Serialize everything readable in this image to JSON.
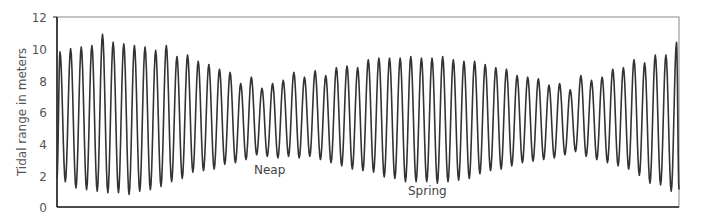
{
  "chart_data": {
    "type": "line",
    "title": "",
    "xlabel": "",
    "ylabel": "Tidal range in meters",
    "ylim": [
      0,
      12
    ],
    "yticks": [
      0,
      2,
      4,
      6,
      8,
      10,
      12
    ],
    "grid": false,
    "legend": null,
    "annotations": [
      {
        "text": "Neap",
        "x_px": 254,
        "y_value": 2.4
      },
      {
        "text": "Spring",
        "x_px": 408,
        "y_value": 1.0
      }
    ],
    "series": [
      {
        "name": "Tide height",
        "color": "#333333",
        "start_value": 1.8,
        "end_value": 1.1,
        "peaks": [
          9.8,
          10.0,
          10.1,
          10.2,
          10.9,
          10.4,
          10.3,
          10.2,
          10.1,
          9.9,
          10.2,
          9.5,
          9.6,
          9.2,
          9.0,
          8.7,
          8.5,
          7.8,
          8.2,
          7.5,
          7.8,
          8.0,
          8.5,
          8.2,
          8.6,
          8.3,
          8.8,
          8.9,
          8.8,
          9.3,
          9.4,
          9.4,
          9.4,
          9.5,
          9.4,
          9.4,
          9.5,
          9.3,
          9.2,
          9.2,
          9.0,
          8.8,
          8.7,
          8.3,
          8.2,
          8.1,
          7.7,
          7.8,
          7.4,
          8.3,
          8.0,
          8.2,
          8.7,
          8.8,
          9.3,
          9.1,
          9.6,
          9.6,
          10.4
        ],
        "troughs": [
          1.6,
          1.2,
          1.1,
          1.0,
          0.9,
          0.9,
          0.8,
          1.0,
          1.1,
          1.3,
          1.6,
          1.8,
          2.2,
          2.3,
          2.4,
          2.7,
          2.8,
          3.0,
          3.3,
          3.2,
          3.1,
          3.2,
          3.1,
          3.2,
          3.0,
          2.8,
          2.6,
          2.4,
          2.3,
          2.2,
          1.9,
          1.8,
          1.6,
          1.6,
          1.6,
          1.5,
          1.6,
          1.7,
          1.8,
          2.1,
          2.3,
          2.4,
          2.6,
          2.8,
          2.9,
          3.0,
          3.1,
          3.3,
          3.5,
          3.2,
          3.0,
          2.8,
          2.6,
          2.4,
          2.0,
          1.5,
          1.4,
          1.0,
          0.9
        ]
      }
    ],
    "layout": {
      "plot_left": 57,
      "plot_right": 679,
      "plot_top": 17,
      "plot_bottom": 207,
      "first_peak_x": 60,
      "period_px": 10.63
    }
  },
  "axis": {
    "y_title": "Tidal range in meters",
    "y_ticks": [
      "0",
      "2",
      "4",
      "6",
      "8",
      "10",
      "12"
    ]
  },
  "labels": {
    "neap": "Neap",
    "spring": "Spring"
  }
}
